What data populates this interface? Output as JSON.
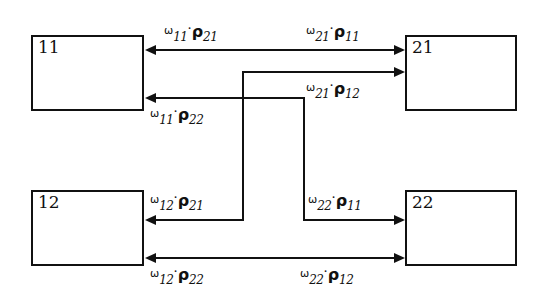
{
  "diagram": {
    "background_color": "#ffffff",
    "line_color": "#111111",
    "width": 546,
    "height": 299,
    "nodes": [
      {
        "id": "n11",
        "label": "11",
        "x": 31,
        "y": 35,
        "w": 113,
        "h": 76
      },
      {
        "id": "n21",
        "label": "21",
        "x": 405,
        "y": 35,
        "w": 112,
        "h": 76
      },
      {
        "id": "n12",
        "label": "12",
        "x": 31,
        "y": 190,
        "w": 113,
        "h": 76
      },
      {
        "id": "n22",
        "label": "22",
        "x": 405,
        "y": 190,
        "w": 112,
        "h": 76
      }
    ],
    "edges": [
      {
        "id": "e1",
        "from": "n21",
        "to": "n11",
        "direction": "left",
        "label_left": {
          "omega": "ω",
          "omega_sub": "11",
          "rho": "ρ",
          "rho_sub": "21"
        },
        "label_right": {
          "omega": "ω",
          "omega_sub": "21",
          "rho": "ρ",
          "rho_sub": "11"
        }
      },
      {
        "id": "e2",
        "from": "n12",
        "to": "n21",
        "direction": "right",
        "label_right": {
          "omega": "ω",
          "omega_sub": "21",
          "rho": "ρ",
          "rho_sub": "12"
        }
      },
      {
        "id": "e3",
        "from": "n22",
        "to": "n11",
        "direction": "left",
        "label_left": {
          "omega": "ω",
          "omega_sub": "11",
          "rho": "ρ",
          "rho_sub": "22"
        }
      },
      {
        "id": "e4",
        "from": "n21",
        "to": "n12",
        "direction": "left",
        "label_left": {
          "omega": "ω",
          "omega_sub": "12",
          "rho": "ρ",
          "rho_sub": "21"
        }
      },
      {
        "id": "e5",
        "from": "n11",
        "to": "n22",
        "direction": "right",
        "label_right": {
          "omega": "ω",
          "omega_sub": "22",
          "rho": "ρ",
          "rho_sub": "11"
        }
      },
      {
        "id": "e6",
        "from": "n22",
        "to": "n12",
        "direction": "both",
        "label_left": {
          "omega": "ω",
          "omega_sub": "12",
          "rho": "ρ",
          "rho_sub": "22"
        },
        "label_right": {
          "omega": "ω",
          "omega_sub": "22",
          "rho": "ρ",
          "rho_sub": "12"
        }
      }
    ],
    "labels": {
      "l_11_21": {
        "omega": "ω",
        "omega_sub": "11",
        "dot": "·",
        "rho": "ρ",
        "rho_sub": "21"
      },
      "l_21_11": {
        "omega": "ω",
        "omega_sub": "21",
        "dot": "·",
        "rho": "ρ",
        "rho_sub": "11"
      },
      "l_21_12": {
        "omega": "ω",
        "omega_sub": "21",
        "dot": "·",
        "rho": "ρ",
        "rho_sub": "12"
      },
      "l_11_22": {
        "omega": "ω",
        "omega_sub": "11",
        "dot": "·",
        "rho": "ρ",
        "rho_sub": "22"
      },
      "l_12_21": {
        "omega": "ω",
        "omega_sub": "12",
        "dot": "·",
        "rho": "ρ",
        "rho_sub": "21"
      },
      "l_22_11": {
        "omega": "ω",
        "omega_sub": "22",
        "dot": "·",
        "rho": "ρ",
        "rho_sub": "11"
      },
      "l_12_22": {
        "omega": "ω",
        "omega_sub": "12",
        "dot": "·",
        "rho": "ρ",
        "rho_sub": "22"
      },
      "l_22_12": {
        "omega": "ω",
        "omega_sub": "22",
        "dot": "·",
        "rho": "ρ",
        "rho_sub": "12"
      }
    }
  }
}
